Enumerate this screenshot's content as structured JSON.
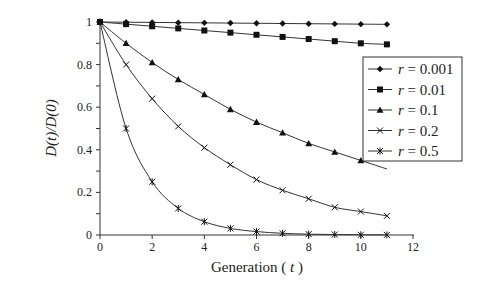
{
  "chart_data": {
    "type": "line",
    "title": "",
    "xlabel": "Generation ( t )",
    "xlabel_main": "Generation (",
    "xlabel_var": "t",
    "xlabel_close": ")",
    "ylabel": "D(t)/D(0)",
    "xlim": [
      0,
      12
    ],
    "ylim": [
      0,
      1
    ],
    "x_ticks": [
      "0",
      "2",
      "4",
      "6",
      "8",
      "10",
      "12"
    ],
    "y_ticks": [
      "0",
      "0.2",
      "0.4",
      "0.6",
      "0.8",
      "1"
    ],
    "grid": false,
    "legend_position": "right",
    "x": [
      0,
      1,
      2,
      3,
      4,
      5,
      6,
      7,
      8,
      9,
      10,
      11
    ],
    "series": [
      {
        "name": "r = 0.001",
        "marker": "diamond",
        "values": [
          1.0,
          0.999,
          0.998,
          0.997,
          0.996,
          0.995,
          0.994,
          0.993,
          0.992,
          0.991,
          0.99,
          0.989
        ]
      },
      {
        "name": "r = 0.01",
        "marker": "square",
        "values": [
          1.0,
          0.99,
          0.98,
          0.97,
          0.96,
          0.95,
          0.94,
          0.93,
          0.92,
          0.91,
          0.9,
          0.895
        ]
      },
      {
        "name": "r = 0.1",
        "marker": "triangle",
        "values": [
          1.0,
          0.9,
          0.81,
          0.73,
          0.66,
          0.59,
          0.53,
          0.48,
          0.43,
          0.39,
          0.35,
          0.31
        ]
      },
      {
        "name": "r = 0.2",
        "marker": "x",
        "values": [
          1.0,
          0.8,
          0.64,
          0.51,
          0.41,
          0.33,
          0.26,
          0.21,
          0.17,
          0.13,
          0.11,
          0.09
        ]
      },
      {
        "name": "r = 0.5",
        "marker": "star",
        "values": [
          1.0,
          0.5,
          0.25,
          0.125,
          0.0625,
          0.031,
          0.016,
          0.008,
          0.004,
          0.002,
          0.001,
          0.0005
        ]
      }
    ],
    "legend": [
      {
        "var": "r",
        "eq": " = 0.001"
      },
      {
        "var": "r",
        "eq": " = 0.01"
      },
      {
        "var": "r",
        "eq": " = 0.1"
      },
      {
        "var": "r",
        "eq": " = 0.2"
      },
      {
        "var": "r",
        "eq": " = 0.5"
      }
    ]
  }
}
